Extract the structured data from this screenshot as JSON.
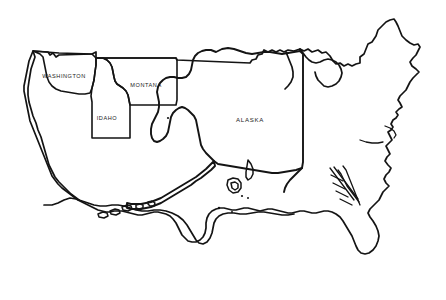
{
  "map": {
    "title": "United States Outline Map",
    "background_color": "#ffffff",
    "line_color": "#141414",
    "labels": [
      {
        "id": "washington",
        "text": "WASHINGTON",
        "x": 64,
        "y": 77
      },
      {
        "id": "montana",
        "text": "MONTANA",
        "x": 146,
        "y": 86
      },
      {
        "id": "idaho",
        "text": "IDAHO",
        "x": 107,
        "y": 119
      },
      {
        "id": "alaska",
        "text": "ALASKA",
        "x": 250,
        "y": 120
      }
    ],
    "regions": [
      {
        "id": "washington",
        "name": "Washington",
        "label": "WASHINGTON"
      },
      {
        "id": "montana",
        "name": "Montana",
        "label": "MONTANA"
      },
      {
        "id": "idaho",
        "name": "Idaho",
        "label": "IDAHO"
      },
      {
        "id": "alaska",
        "name": "Alaska",
        "label": "ALASKA"
      }
    ]
  }
}
